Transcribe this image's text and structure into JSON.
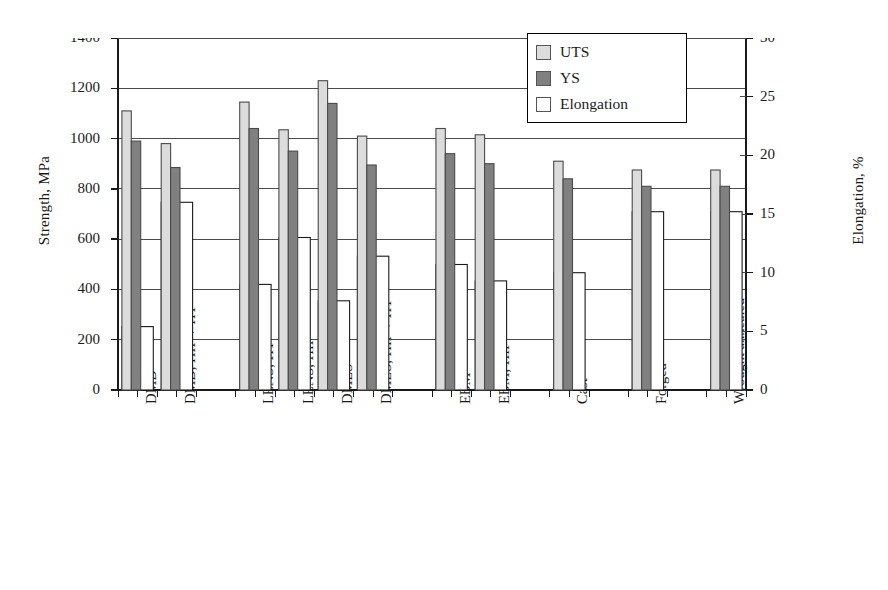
{
  "chart_data": {
    "type": "bar",
    "title": "",
    "subtitle": "",
    "xlabel": "",
    "ylabel": "Strength, MPa",
    "y2label": "Elongation, %",
    "ylim": [
      0,
      1400
    ],
    "y2lim": [
      0,
      30
    ],
    "yticks": [
      0,
      200,
      400,
      600,
      800,
      1000,
      1200,
      1400
    ],
    "y2ticks": [
      0,
      5,
      10,
      15,
      20,
      25,
      30
    ],
    "grid": true,
    "legend_position": "top-right",
    "legend": [
      "UTS",
      "YS",
      "Elongation"
    ],
    "categories": [
      "DMD",
      "DMD, HIP + HT",
      "LENS, HT",
      "LENS, HIP",
      "DMLS",
      "DMLS, HIP + HT",
      "EBM",
      "EBM, HIP",
      "Cast",
      "Forged",
      "Wrought annealed"
    ],
    "gap_after": [
      1,
      5,
      7,
      8,
      9
    ],
    "series": [
      {
        "name": "UTS",
        "axis": "left",
        "units": "MPa",
        "color": "#dcdcdc",
        "values": [
          1110,
          980,
          1145,
          1035,
          1230,
          1010,
          1040,
          1015,
          910,
          875,
          875
        ]
      },
      {
        "name": "YS",
        "axis": "left",
        "units": "MPa",
        "color": "#808080",
        "values": [
          990,
          885,
          1040,
          950,
          1140,
          895,
          940,
          900,
          840,
          810,
          810
        ]
      },
      {
        "name": "Elongation",
        "axis": "right",
        "units": "%",
        "color": "#ffffff",
        "values": [
          5.4,
          16.0,
          9.0,
          13.0,
          7.6,
          11.4,
          10.7,
          9.3,
          10.0,
          15.2,
          15.2
        ]
      }
    ]
  },
  "legend": {
    "items": [
      {
        "label": "UTS",
        "swatch": "#dcdcdc"
      },
      {
        "label": "YS",
        "swatch": "#808080"
      },
      {
        "label": "Elongation",
        "swatch": "#ffffff"
      }
    ]
  }
}
